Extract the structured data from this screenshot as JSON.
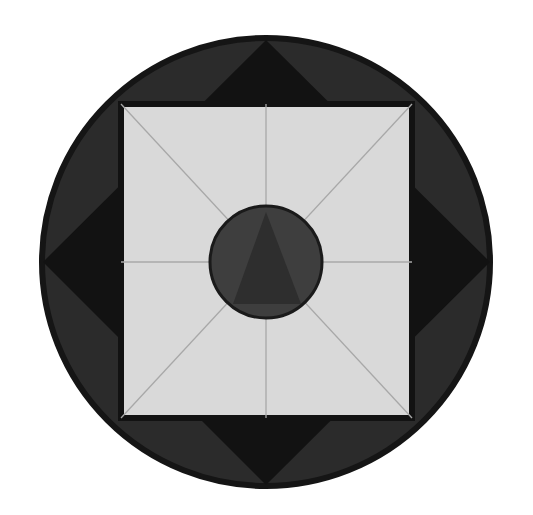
{
  "diagram": {
    "canvas": {
      "width": 533,
      "height": 515,
      "background": "#ffffff"
    },
    "colors": {
      "outer_ring": "#2b2b2b",
      "outer_ring_border": "#151515",
      "diamond": "#121212",
      "square_fill": "#d9d9d9",
      "square_border": "#121212",
      "guide_lines": "#a8a8a8",
      "inner_circle": "#3e3e3e",
      "inner_circle_border": "#1a1a1a",
      "triangle": "#2e2e2e"
    },
    "outer_circle": {
      "cx": 266,
      "cy": 262,
      "r": 224
    },
    "diamond": {
      "top": [
        266,
        40
      ],
      "right": [
        490,
        262
      ],
      "bottom": [
        266,
        485
      ],
      "left": [
        43,
        262
      ]
    },
    "square": {
      "x": 121,
      "y": 104,
      "width": 291,
      "height": 314
    },
    "guide_lines": [
      {
        "name": "vertical",
        "x1": 266,
        "y1": 104,
        "x2": 266,
        "y2": 418
      },
      {
        "name": "horizontal",
        "x1": 121,
        "y1": 262,
        "x2": 412,
        "y2": 262
      },
      {
        "name": "diagonal-1",
        "x1": 121,
        "y1": 104,
        "x2": 412,
        "y2": 418
      },
      {
        "name": "diagonal-2",
        "x1": 412,
        "y1": 104,
        "x2": 121,
        "y2": 418
      }
    ],
    "inner_circle": {
      "cx": 266,
      "cy": 262,
      "r": 56
    },
    "triangle": {
      "apex": [
        266,
        212
      ],
      "base_left": [
        233,
        304
      ],
      "base_right": [
        301,
        304
      ]
    }
  }
}
